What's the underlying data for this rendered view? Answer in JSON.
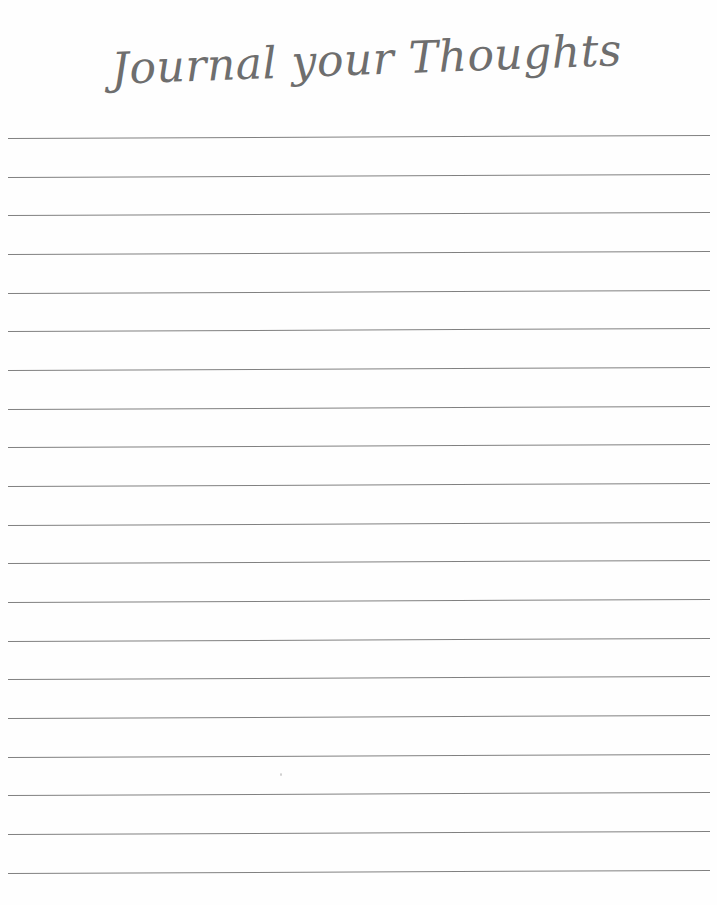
{
  "page": {
    "title": "Journal your Thoughts of the Month:",
    "background_color": "#fefefe",
    "width": 717,
    "height": 905
  },
  "heading": {
    "text": "Journal your Thoughts of the Month:",
    "style": "handwritten-script",
    "color": "#6e6e6e",
    "left": 110,
    "right": 648,
    "baseline_y": 78
  },
  "ruled_lines": {
    "count": 20,
    "color": "#808080",
    "thickness_px": 1.4,
    "x_start": 8,
    "x_end": 710,
    "first_line_y": 138,
    "last_line_y": 873,
    "spacing_px": 38.7,
    "tilt_deg": -0.25,
    "y_positions": [
      138,
      177,
      215,
      254,
      293,
      331,
      370,
      409,
      447,
      486,
      525,
      563,
      602,
      641,
      679,
      718,
      757,
      795,
      834,
      873
    ]
  },
  "speck": {
    "x": 280,
    "y": 773,
    "color": "#cfcfcf"
  }
}
